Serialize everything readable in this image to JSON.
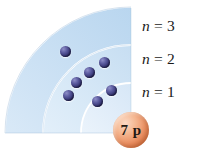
{
  "figure": {
    "background_color": "#ffffff",
    "width": 203,
    "height": 156
  },
  "nucleus": {
    "label": "7 p",
    "proton_count": 7,
    "particle_symbol": "p",
    "fill_color": "#ea8d5f",
    "text_color": "#231a14",
    "center": {
      "x": 131,
      "y": 130
    },
    "radius": 18
  },
  "shell_labels": [
    {
      "name": "n-equals-3",
      "variable": "n",
      "equals": "=",
      "value": "3",
      "text": "n = 3",
      "x": 142,
      "y": 18
    },
    {
      "name": "n-equals-2",
      "variable": "n",
      "equals": "=",
      "value": "2",
      "text": "n = 2",
      "x": 142,
      "y": 51
    },
    {
      "name": "n-equals-1",
      "variable": "n",
      "equals": "=",
      "value": "1",
      "text": "n = 1",
      "x": 142,
      "y": 84
    }
  ],
  "shells": [
    {
      "name": "shell-n1",
      "n": 1,
      "inner_radius": 18,
      "outer_radius": 50,
      "fill_color": "#dbe9f6",
      "electron_count": 2
    },
    {
      "name": "shell-n2",
      "n": 2,
      "inner_radius": 50,
      "outer_radius": 88,
      "fill_color": "#cfe2f4",
      "electron_count": 4
    },
    {
      "name": "shell-n3",
      "n": 3,
      "inner_radius": 88,
      "outer_radius": 126,
      "fill_color": "#c3dcf1",
      "electron_count": 1
    }
  ],
  "electrons": [
    {
      "name": "electron-n3-1",
      "shell": 3,
      "x": 65,
      "y": 51,
      "color": "#3b3a78"
    },
    {
      "name": "electron-n2-1",
      "shell": 2,
      "x": 104,
      "y": 62,
      "color": "#3b3a78"
    },
    {
      "name": "electron-n2-2",
      "shell": 2,
      "x": 89,
      "y": 72,
      "color": "#3b3a78"
    },
    {
      "name": "electron-n2-3",
      "shell": 2,
      "x": 76,
      "y": 82,
      "color": "#3b3a78"
    },
    {
      "name": "electron-n2-4",
      "shell": 2,
      "x": 68,
      "y": 95,
      "color": "#3b3a78"
    },
    {
      "name": "electron-n1-1",
      "shell": 1,
      "x": 111,
      "y": 90,
      "color": "#3b3a78"
    },
    {
      "name": "electron-n1-2",
      "shell": 1,
      "x": 97,
      "y": 101,
      "color": "#3b3a78"
    }
  ],
  "colors": {
    "shell_outer": "#c3dcf1",
    "shell_middle": "#cfe2f4",
    "shell_inner": "#dbe9f6",
    "shell_edge": "#ffffff",
    "electron": "#3b3a78",
    "nucleus": "#ea8d5f",
    "label_text": "#1a1a1a"
  }
}
